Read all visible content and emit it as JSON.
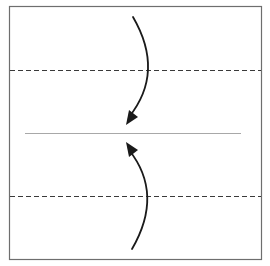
{
  "diagram": {
    "type": "origami-fold-instruction",
    "colors": {
      "background": "#ffffff",
      "paper_border": "#6e6e6e",
      "dashed_line": "#3a3a3a",
      "center_line": "#a8a8a8",
      "arrow": "#1a1a1a"
    },
    "paper": {
      "x": 9,
      "y": 6,
      "width": 252,
      "height": 253
    },
    "fold_lines": [
      {
        "name": "top-fold-line",
        "style": "dashed",
        "y": 70,
        "x1": 9,
        "x2": 261
      },
      {
        "name": "bottom-fold-line",
        "style": "dashed",
        "y": 196,
        "x1": 9,
        "x2": 261
      }
    ],
    "center_line": {
      "style": "solid",
      "y": 133,
      "x1": 25,
      "x2": 241
    },
    "arrows": [
      {
        "name": "fold-down-arrow",
        "direction": "down",
        "start": [
          133,
          17
        ],
        "control": [
          165,
          72
        ],
        "end": [
          128,
          123
        ]
      },
      {
        "name": "fold-up-arrow",
        "direction": "up",
        "start": [
          132,
          249
        ],
        "control": [
          164,
          194
        ],
        "end": [
          128,
          143
        ]
      }
    ]
  }
}
